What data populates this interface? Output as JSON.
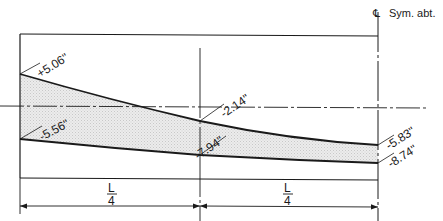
{
  "diagram": {
    "symmetry_label": "Sym. abt.",
    "centerline_symbol": "℄",
    "colors": {
      "line": "#1a1a1a",
      "fill": "#e2e2e2",
      "background": "#ffffff"
    },
    "top_values": {
      "left": "+5.06\"",
      "mid": "-2.14\"",
      "right": "-5.83\""
    },
    "bottom_values": {
      "left": "-5.56\"",
      "mid": "-7.94\"",
      "right": "-8.74\""
    },
    "dimensions": [
      {
        "numerator": "L",
        "denominator": "4"
      },
      {
        "numerator": "L",
        "denominator": "4"
      }
    ]
  }
}
